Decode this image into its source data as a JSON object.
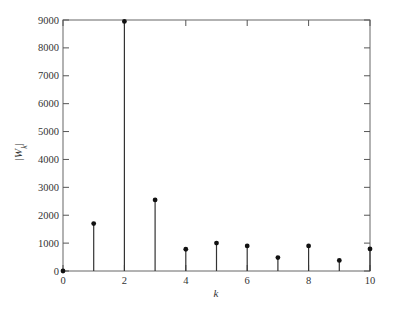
{
  "chart_data": {
    "type": "stem",
    "title": "",
    "xlabel": "k",
    "ylabel": "|W_k|",
    "ylabel_main": "|W",
    "ylabel_sub": "k",
    "ylabel_close": "|",
    "x": [
      0,
      1,
      2,
      3,
      4,
      5,
      6,
      7,
      8,
      9,
      10
    ],
    "values": [
      0,
      1700,
      8950,
      2550,
      780,
      1000,
      900,
      480,
      900,
      380,
      790
    ],
    "xlim": [
      0,
      10
    ],
    "ylim": [
      0,
      9000
    ],
    "xticks": [
      0,
      2,
      4,
      6,
      8,
      10
    ],
    "xtick_labels": [
      "0",
      "2",
      "4",
      "6",
      "8",
      "10"
    ],
    "yticks": [
      0,
      1000,
      2000,
      3000,
      4000,
      5000,
      6000,
      7000,
      8000,
      9000
    ],
    "ytick_labels": [
      "0",
      "1000",
      "2000",
      "3000",
      "4000",
      "5000",
      "6000",
      "7000",
      "8000",
      "9000"
    ],
    "grid": false,
    "legend": null,
    "colors": {
      "stem": "#333333",
      "marker": "#111111",
      "axis": "#555555"
    }
  }
}
